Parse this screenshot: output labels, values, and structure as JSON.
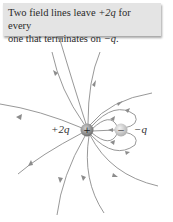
{
  "callout": {
    "line1_prefix": "Two field lines leave ",
    "line1_charge": "+2q",
    "line1_suffix": " for every",
    "line2_prefix": "one that terminates on ",
    "line2_charge": "−q",
    "line2_suffix": "."
  },
  "charges": {
    "positive": {
      "label": "+2q",
      "sign": "+",
      "color": "#8a8a8a"
    },
    "negative": {
      "label": "−q",
      "sign": "−",
      "color": "#c8c8c8"
    }
  },
  "colors": {
    "field_line": "#8c8c8c",
    "callout_bg": "#e4e4e4",
    "text": "#2a2a2a"
  }
}
